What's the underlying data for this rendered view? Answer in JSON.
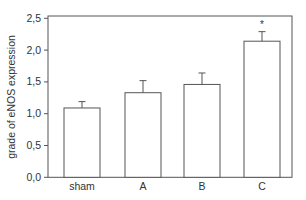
{
  "chart_data": {
    "type": "bar",
    "title": "",
    "xlabel": "",
    "ylabel": "grade of eNOS expression",
    "categories": [
      "sham",
      "A",
      "B",
      "C"
    ],
    "values": [
      1.09,
      1.33,
      1.46,
      2.14
    ],
    "error_bars": [
      0.1,
      0.19,
      0.18,
      0.15
    ],
    "error_bar_style": "upper-only",
    "annotations": [
      {
        "category": "C",
        "text": "*"
      }
    ],
    "ylim": [
      0,
      2.5
    ],
    "yticks": [
      0.0,
      0.5,
      1.0,
      1.5,
      2.0,
      2.5
    ],
    "ytick_labels": [
      "0,0",
      "0,5",
      "1,0",
      "1,5",
      "2,0",
      "2,5"
    ],
    "grid": false,
    "legend": null,
    "bar_fill": "#ffffff",
    "bar_stroke": "#555555"
  }
}
